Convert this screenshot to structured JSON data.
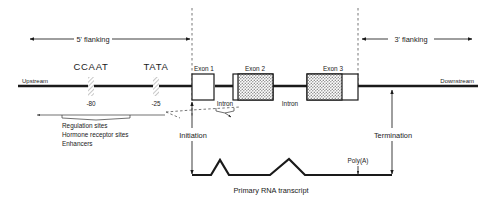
{
  "diagram": {
    "colors": {
      "ink": "#1a1a1a",
      "shade": "#b0b0b0",
      "dash": "#4a4a4a",
      "background": "#ffffff"
    }
  },
  "flanking": {
    "five_prime": "5' flanking",
    "three_prime": "3' flanking"
  },
  "strand": {
    "upstream": "Upstream",
    "downstream": "Downstream"
  },
  "promoter": {
    "ccaat_label": "CCAAT",
    "tata_label": "TATA",
    "ccaat_position": "-80",
    "tata_position": "-25"
  },
  "regulation": {
    "line1": "Regulation sites",
    "line2": "Hormone receptor sites",
    "line3": "Enhancers"
  },
  "exons": [
    {
      "label": "Exon 1",
      "fill": "open"
    },
    {
      "label": "Exon 2",
      "fill": "shaded-right"
    },
    {
      "label": "Exon 3",
      "fill": "shaded-left"
    }
  ],
  "introns": [
    {
      "label": "Intron"
    },
    {
      "label": "Intron"
    }
  ],
  "events": {
    "initiation": "Initiation",
    "termination": "Termination"
  },
  "transcript": {
    "caption": "Primary RNA transcript",
    "poly_a": "Poly(A)"
  }
}
